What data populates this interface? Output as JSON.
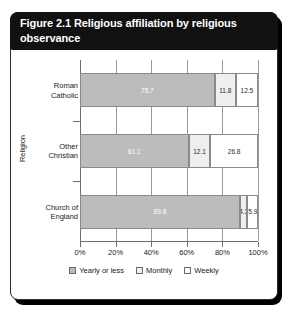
{
  "figure": {
    "title": "Figure 2.1 Religious affiliation by religious observance"
  },
  "axes": {
    "y_title": "Religion",
    "x_ticks": [
      "0%",
      "20%",
      "40%",
      "60%",
      "80%",
      "100%"
    ],
    "categories": [
      "Roman Catholic",
      "Other Christian",
      "Church of England"
    ]
  },
  "legend": {
    "items": [
      {
        "label": "Yearly or less",
        "color": "#bcbcbc"
      },
      {
        "label": "Monthly",
        "color": "#efefef"
      },
      {
        "label": "Weekly",
        "color": "#ffffff"
      }
    ]
  },
  "chart_data": {
    "type": "bar",
    "orientation": "horizontal",
    "stacked": true,
    "stack_total": 100,
    "title": "Figure 2.1 Religious affiliation by religious observance",
    "xlabel": "",
    "ylabel": "Religion",
    "xlim": [
      0,
      100
    ],
    "xtick_values": [
      0,
      20,
      40,
      60,
      80,
      100
    ],
    "xtick_labels": [
      "0%",
      "20%",
      "40%",
      "60%",
      "80%",
      "100%"
    ],
    "grid": "vertical",
    "legend_position": "bottom-center",
    "categories": [
      "Roman Catholic",
      "Other Christian",
      "Church of England"
    ],
    "series": [
      {
        "name": "Yearly or less",
        "color": "#bcbcbc",
        "values": [
          75.7,
          61.1,
          89.8
        ]
      },
      {
        "name": "Monthly",
        "color": "#efefef",
        "values": [
          11.8,
          12.1,
          4.3
        ]
      },
      {
        "name": "Weekly",
        "color": "#ffffff",
        "values": [
          12.5,
          26.8,
          5.9
        ]
      }
    ],
    "data_labels": [
      [
        "75.7",
        "11.8",
        "12.5"
      ],
      [
        "61.1",
        "12.1",
        "26.8"
      ],
      [
        "89.8",
        "4.3",
        "5.9"
      ]
    ]
  }
}
